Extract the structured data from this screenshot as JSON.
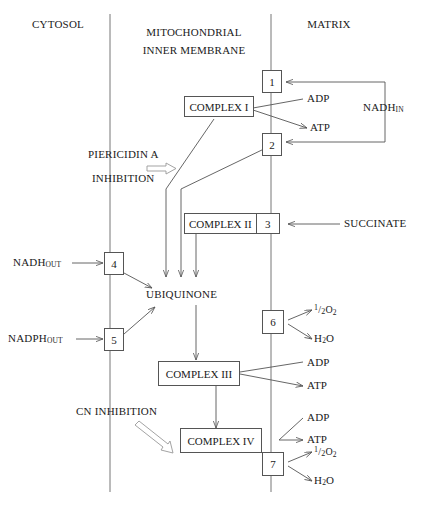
{
  "diagram": {
    "regions": [
      {
        "id": "cytosol",
        "label": "CYTOSOL"
      },
      {
        "id": "membrane",
        "label_line1": "MITOCHONDRIAL",
        "label_line2": "INNER MEMBRANE"
      },
      {
        "id": "matrix",
        "label": "MATRIX"
      }
    ],
    "complexes": [
      {
        "id": "complex-1",
        "label": "COMPLEX I",
        "site": "1"
      },
      {
        "id": "complex-2",
        "label": "COMPLEX II",
        "site": "3"
      },
      {
        "id": "complex-3",
        "label": "COMPLEX III",
        "site": ""
      },
      {
        "id": "complex-4",
        "label": "COMPLEX IV",
        "site": ""
      }
    ],
    "sites": [
      {
        "id": "site-1",
        "label": "1"
      },
      {
        "id": "site-2",
        "label": "2"
      },
      {
        "id": "site-3",
        "label": "3"
      },
      {
        "id": "site-4",
        "label": "4"
      },
      {
        "id": "site-5",
        "label": "5"
      },
      {
        "id": "site-6",
        "label": "6"
      },
      {
        "id": "site-7",
        "label": "7"
      }
    ],
    "carrier": {
      "id": "ubiquinone",
      "label": "UBIQUINONE"
    },
    "substrates": [
      {
        "id": "nadh-in",
        "base": "NADH",
        "sub": "IN"
      },
      {
        "id": "nadh-out",
        "base": "NADH",
        "sub": "OUT"
      },
      {
        "id": "nadph-out",
        "base": "NADPH",
        "sub": "OUT"
      },
      {
        "id": "succinate",
        "base": "SUCCINATE",
        "sub": ""
      }
    ],
    "energetics": [
      {
        "id": "adp-1",
        "label": "ADP"
      },
      {
        "id": "atp-1",
        "label": "ATP"
      },
      {
        "id": "adp-3",
        "label": "ADP"
      },
      {
        "id": "atp-3",
        "label": "ATP"
      },
      {
        "id": "adp-4",
        "label": "ADP"
      },
      {
        "id": "atp-4",
        "label": "ATP"
      }
    ],
    "oxygen": [
      {
        "id": "o2-site-6",
        "num": "1",
        "slash": "/",
        "den": "2",
        "formula_base": "O",
        "formula_sub": "2"
      },
      {
        "id": "h2o-site-6",
        "base": "H",
        "sub": "2",
        "tail": "O"
      },
      {
        "id": "o2-site-7",
        "num": "1",
        "slash": "/",
        "den": "2",
        "formula_base": "O",
        "formula_sub": "2"
      },
      {
        "id": "h2o-site-7",
        "base": "H",
        "sub": "2",
        "tail": "O"
      }
    ],
    "inhibitors": [
      {
        "id": "piericidin",
        "line1": "PIERICIDIN A",
        "line2": "INHIBITION"
      },
      {
        "id": "cyanide",
        "line1": "CN INHIBITION",
        "line2": ""
      }
    ],
    "colors": {
      "stroke": "#555555",
      "text": "#1a1a1a",
      "background": "#ffffff"
    }
  }
}
